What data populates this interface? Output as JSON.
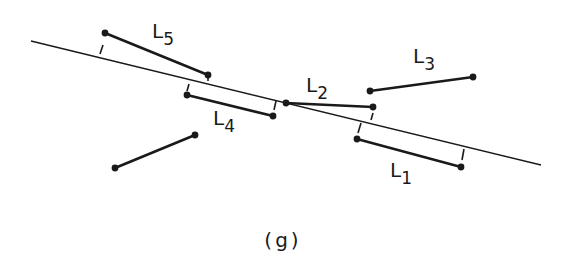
{
  "caption": "(g)",
  "colors": {
    "ink": "#1a1a1a",
    "background": "#ffffff"
  },
  "diagram": {
    "reference_line": {
      "x1": 31,
      "y1": 41,
      "x2": 541,
      "y2": 165
    },
    "segments": [
      {
        "id": "L1",
        "label": "L",
        "sub": "1",
        "x1": 357,
        "y1": 139,
        "x2": 461,
        "y2": 167,
        "label_x": 390,
        "label_y": 177,
        "ticks": [
          [
            361,
            123,
            358,
            133
          ],
          [
            464,
            149,
            462,
            160
          ]
        ]
      },
      {
        "id": "L2",
        "label": "L",
        "sub": "2",
        "x1": 286,
        "y1": 103,
        "x2": 373,
        "y2": 107,
        "label_x": 306,
        "label_y": 92,
        "ticks": [
          [
            373,
            113,
            371,
            120
          ]
        ]
      },
      {
        "id": "L3",
        "label": "L",
        "sub": "3",
        "x1": 370,
        "y1": 91,
        "x2": 473,
        "y2": 77,
        "label_x": 413,
        "label_y": 63,
        "ticks": []
      },
      {
        "id": "L4",
        "label": "L",
        "sub": "4",
        "x1": 187,
        "y1": 95,
        "x2": 273,
        "y2": 116,
        "label_x": 213,
        "label_y": 125,
        "ticks": [
          [
            189,
            84,
            187,
            91
          ],
          [
            276,
            101,
            274,
            110
          ]
        ]
      },
      {
        "id": "L5",
        "label": "L",
        "sub": "5",
        "x1": 105,
        "y1": 33,
        "x2": 208,
        "y2": 75,
        "label_x": 152,
        "label_y": 38,
        "ticks": [
          [
            103,
            45,
            100,
            54
          ],
          [
            208,
            75,
            208,
            81
          ]
        ]
      },
      {
        "id": "unlabeled",
        "label": "",
        "sub": "",
        "x1": 115,
        "y1": 168,
        "x2": 195,
        "y2": 135,
        "ticks": []
      }
    ]
  },
  "labels": {
    "L1": "L",
    "L1_sub": "1",
    "L2": "L",
    "L2_sub": "2",
    "L3": "L",
    "L3_sub": "3",
    "L4": "L",
    "L4_sub": "4",
    "L5": "L",
    "L5_sub": "5"
  }
}
